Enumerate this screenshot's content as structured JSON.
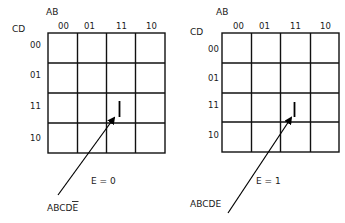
{
  "maps": [
    {
      "col_var": "AB",
      "row_var": "CD",
      "columns": [
        "00",
        "01",
        "11",
        "10"
      ],
      "rows": [
        "00",
        "01",
        "11",
        "10"
      ],
      "marked_cell": {
        "row": "11",
        "col": "11",
        "value": "1"
      },
      "caption": "E = 0",
      "annotation": "ABCDE",
      "annotation_overbar_on": "E"
    },
    {
      "col_var": "AB",
      "row_var": "CD",
      "columns": [
        "00",
        "01",
        "11",
        "10"
      ],
      "rows": [
        "00",
        "01",
        "11",
        "10"
      ],
      "marked_cell": {
        "row": "11",
        "col": "11",
        "value": "1"
      },
      "caption": "E = 1",
      "annotation": "ABCDE"
    }
  ]
}
